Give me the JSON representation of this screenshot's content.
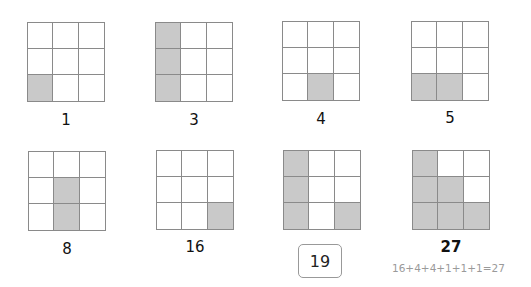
{
  "colors": {
    "shaded": "#c9c9c9",
    "grid_line": "#8a8a8a",
    "formula_text": "#9a9a9a"
  },
  "panels": [
    {
      "label": "1",
      "cells": [
        0,
        0,
        0,
        0,
        0,
        0,
        1,
        0,
        0
      ]
    },
    {
      "label": "3",
      "cells": [
        1,
        0,
        0,
        1,
        0,
        0,
        1,
        0,
        0
      ]
    },
    {
      "label": "4",
      "cells": [
        0,
        0,
        0,
        0,
        0,
        0,
        0,
        1,
        0
      ]
    },
    {
      "label": "5",
      "cells": [
        0,
        0,
        0,
        0,
        0,
        0,
        1,
        1,
        0
      ]
    },
    {
      "label": "8",
      "cells": [
        0,
        0,
        0,
        0,
        1,
        0,
        0,
        1,
        0
      ]
    },
    {
      "label": "16",
      "cells": [
        0,
        0,
        0,
        0,
        0,
        0,
        0,
        0,
        1
      ]
    },
    {
      "label": "19",
      "cells": [
        1,
        0,
        0,
        1,
        0,
        0,
        1,
        0,
        1
      ],
      "boxed": true
    },
    {
      "label": "27",
      "cells": [
        1,
        0,
        0,
        1,
        1,
        0,
        1,
        1,
        1
      ],
      "formula": "16+4+4+1+1+1=27"
    }
  ]
}
